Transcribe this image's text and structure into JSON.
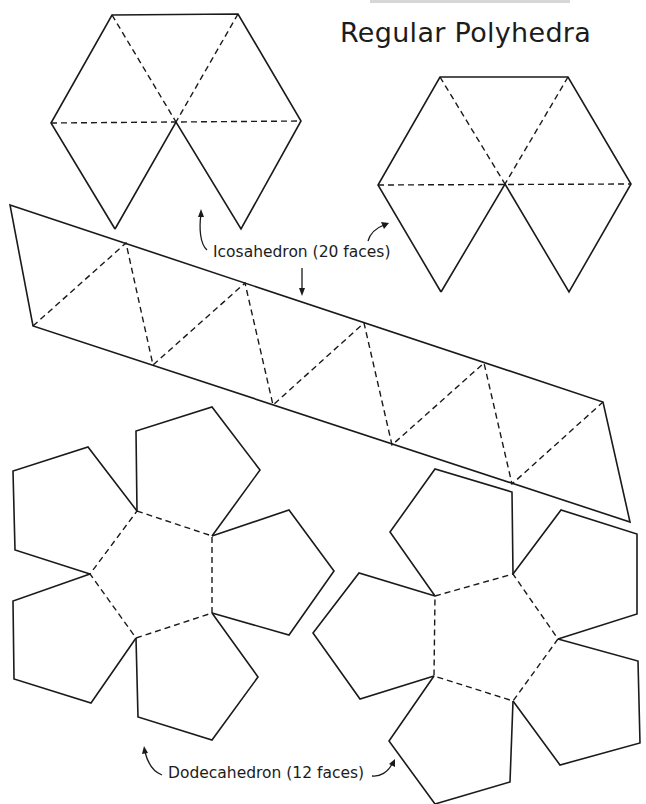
{
  "page": {
    "header_text": "",
    "title": "Regular Polyhedra"
  },
  "labels": {
    "icosahedron": "Icosahedron (20 faces)",
    "dodecahedron": "Dodecahedron (12 faces)"
  },
  "colors": {
    "line": "#1a1a1a",
    "background": "#ffffff"
  },
  "nets": {
    "icosahedron": {
      "faces": 20,
      "parts": [
        "top-left hexagon cap (6 triangles)",
        "top-right hexagon cap (6 triangles)",
        "center strip (10 triangles)"
      ]
    },
    "dodecahedron": {
      "faces": 12,
      "parts": [
        "left flower (6 pentagons)",
        "right flower (6 pentagons)"
      ]
    }
  }
}
